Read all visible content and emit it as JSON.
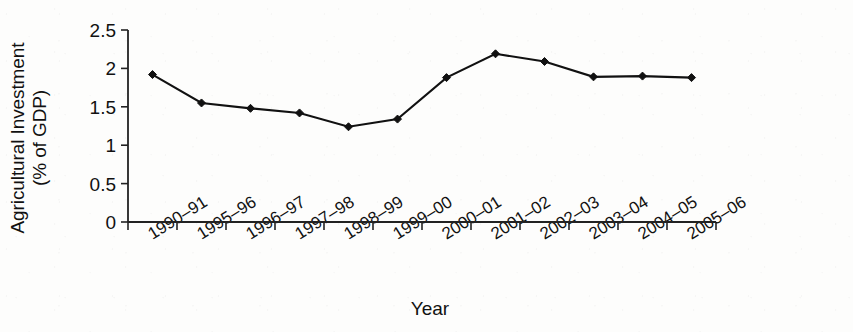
{
  "chart_data": {
    "type": "line",
    "title": "",
    "xlabel": "Year",
    "ylabel": "Agricultural Investment (% of GDP)",
    "ylabel_line1": "Agricultural Investment",
    "ylabel_line2": "(% of GDP)",
    "grid": false,
    "legend": false,
    "ylim": [
      0,
      2.5
    ],
    "yticks": [
      0,
      0.5,
      1,
      1.5,
      2,
      2.5
    ],
    "ytick_labels": [
      "0",
      "0.5",
      "1",
      "1.5",
      "2",
      "2.5"
    ],
    "categories": [
      "1990–91",
      "1995–96",
      "1996–97",
      "1997–98",
      "1998–99",
      "1999–00",
      "2000–01",
      "2001–02",
      "2002–03",
      "2003–04",
      "2004–05",
      "2005–06"
    ],
    "values": [
      1.92,
      1.55,
      1.48,
      1.42,
      1.24,
      1.34,
      1.88,
      2.19,
      2.09,
      1.89,
      1.9,
      1.88
    ],
    "marker": "diamond",
    "line_color": "#111111",
    "marker_color": "#111111"
  }
}
